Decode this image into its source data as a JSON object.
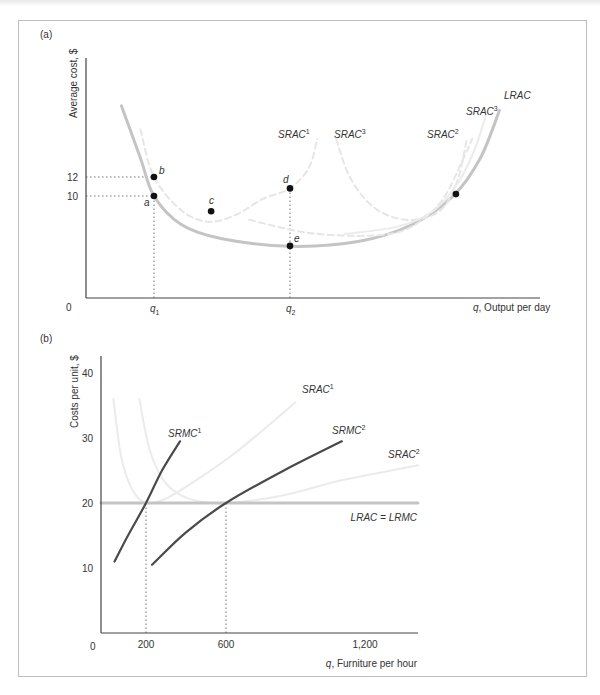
{
  "chart_data": [
    {
      "panel_label": "(a)",
      "type": "line",
      "title": "",
      "ylabel": "Average cost, $",
      "xlabel": "q, Output per day",
      "xlabel_var": "q",
      "xlabel_text": ", Output per day",
      "origin_label": "0",
      "y_ticks": [
        {
          "value": 12,
          "label": "12"
        },
        {
          "value": 10,
          "label": "10"
        }
      ],
      "x_ticks": [
        {
          "label": "q",
          "sub": "1",
          "x": 2.5
        },
        {
          "label": "q",
          "sub": "2",
          "x": 7.5
        }
      ],
      "xlim": [
        0,
        16
      ],
      "ylim": [
        0,
        22
      ],
      "grid": false,
      "curves": [
        {
          "name": "LRAC",
          "label": "LRAC",
          "style": "solid-gray-thick",
          "points": [
            [
              1.3,
              19.5
            ],
            [
              2,
              14
            ],
            [
              2.5,
              10
            ],
            [
              3.5,
              7
            ],
            [
              5,
              5.5
            ],
            [
              7.5,
              4.7
            ],
            [
              10,
              5.2
            ],
            [
              12,
              7
            ],
            [
              13.5,
              10
            ],
            [
              14.5,
              14
            ],
            [
              15.2,
              19
            ]
          ]
        },
        {
          "name": "SRAC1",
          "label": "SRAC",
          "sup": "1",
          "style": "dashed-light",
          "points": [
            [
              2,
              17
            ],
            [
              2.5,
              12
            ],
            [
              3.5,
              8.5
            ],
            [
              4.5,
              7.3
            ],
            [
              5.5,
              8
            ],
            [
              6.5,
              9.7
            ],
            [
              7.5,
              10.8
            ],
            [
              8.2,
              13
            ],
            [
              8.5,
              16
            ]
          ]
        },
        {
          "name": "SRAC3-mid",
          "label": "SRAC",
          "sup": "3",
          "style": "dashed-light",
          "points": [
            [
              9.2,
              16
            ],
            [
              9.7,
              12
            ],
            [
              10.5,
              9
            ],
            [
              11.5,
              7.6
            ],
            [
              12.5,
              7.7
            ],
            [
              13.2,
              9
            ],
            [
              13.7,
              12
            ],
            [
              14,
              16
            ]
          ]
        },
        {
          "name": "SRAC2",
          "label": "SRAC",
          "sup": "2",
          "style": "dashed-light",
          "points": [
            [
              6,
              7.5
            ],
            [
              8,
              6.2
            ],
            [
              10,
              5.8
            ],
            [
              11.5,
              6.2
            ],
            [
              12.5,
              7.8
            ],
            [
              13.2,
              10
            ],
            [
              13.8,
              13.5
            ],
            [
              14.2,
              16
            ]
          ]
        },
        {
          "name": "SRAC3-right",
          "label": "SRAC",
          "sup": "3",
          "style": "solid-light",
          "points": [
            [
              9.5,
              6
            ],
            [
              11.5,
              6.8
            ],
            [
              12.8,
              8.5
            ],
            [
              13.7,
              11.5
            ],
            [
              14.3,
              15
            ],
            [
              14.7,
              18.5
            ]
          ]
        }
      ],
      "points": [
        {
          "name": "a",
          "x": 2.5,
          "y": 10
        },
        {
          "name": "b",
          "x": 2.5,
          "y": 12
        },
        {
          "name": "c",
          "x": 4.6,
          "y": 8.4
        },
        {
          "name": "d",
          "x": 7.5,
          "y": 10.8
        },
        {
          "name": "e",
          "x": 7.5,
          "y": 4.75
        },
        {
          "name": "",
          "x": 13.6,
          "y": 10.2
        }
      ],
      "guides": [
        {
          "from": [
            0,
            12
          ],
          "to": [
            2.5,
            12
          ]
        },
        {
          "from": [
            0,
            10
          ],
          "to": [
            2.5,
            10
          ]
        },
        {
          "from": [
            2.5,
            0
          ],
          "to": [
            2.5,
            10
          ]
        },
        {
          "from": [
            7.5,
            0
          ],
          "to": [
            7.5,
            10.8
          ]
        }
      ]
    },
    {
      "panel_label": "(b)",
      "type": "line",
      "title": "",
      "ylabel": "Costs per unit, $",
      "xlabel": "q, Furniture per hour",
      "xlabel_var": "q",
      "xlabel_text": ", Furniture per hour",
      "origin_label": "0",
      "y_ticks": [
        {
          "value": 10,
          "label": "10"
        },
        {
          "value": 20,
          "label": "20"
        },
        {
          "value": 30,
          "label": "30"
        },
        {
          "value": 40,
          "label": "40"
        }
      ],
      "x_ticks": [
        {
          "value": 200,
          "label": "200"
        },
        {
          "value": 600,
          "label": "600"
        },
        {
          "value": 1200,
          "label": "1,200"
        }
      ],
      "xlim": [
        0,
        1400
      ],
      "ylim": [
        0,
        43
      ],
      "grid": false,
      "curves": [
        {
          "name": "LRAC=LRMC",
          "label": "LRAC = LRMC",
          "style": "solid-gray-thick",
          "points": [
            [
              0,
              20
            ],
            [
              1400,
              20
            ]
          ]
        },
        {
          "name": "SRMC1",
          "label": "SRMC",
          "sup": "1",
          "style": "solid-dark",
          "points": [
            [
              60,
              11
            ],
            [
              120,
              15
            ],
            [
              200,
              20
            ],
            [
              280,
              25
            ],
            [
              370,
              29.5
            ]
          ]
        },
        {
          "name": "SRMC2",
          "label": "SRMC",
          "sup": "2",
          "style": "solid-dark",
          "points": [
            [
              230,
              10.5
            ],
            [
              400,
              15.5
            ],
            [
              600,
              20
            ],
            [
              850,
              25
            ],
            [
              1100,
              29.5
            ]
          ]
        },
        {
          "name": "SRAC1",
          "label": "SRAC",
          "sup": "1",
          "style": "solid-light",
          "points": [
            [
              55,
              36
            ],
            [
              90,
              27
            ],
            [
              140,
              22
            ],
            [
              200,
              20
            ],
            [
              300,
              20.7
            ],
            [
              450,
              23.5
            ],
            [
              650,
              28
            ],
            [
              900,
              35.5
            ]
          ]
        },
        {
          "name": "SRAC2",
          "label": "SRAC",
          "sup": "2",
          "style": "solid-light",
          "points": [
            [
              170,
              36
            ],
            [
              220,
              28
            ],
            [
              300,
              23
            ],
            [
              420,
              20.6
            ],
            [
              600,
              20
            ],
            [
              850,
              21.2
            ],
            [
              1100,
              23.5
            ],
            [
              1400,
              25.8
            ]
          ]
        }
      ],
      "guides": [
        {
          "from": [
            200,
            0
          ],
          "to": [
            200,
            20
          ]
        },
        {
          "from": [
            600,
            0
          ],
          "to": [
            600,
            20
          ]
        }
      ]
    }
  ]
}
